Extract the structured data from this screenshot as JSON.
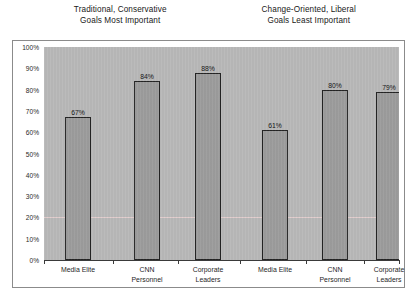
{
  "titles": {
    "left": {
      "line1": "Traditional, Conservative",
      "line2": "Goals Most Important"
    },
    "right": {
      "line1": "Change-Oriented, Liberal",
      "line2": "Goals Least Important"
    }
  },
  "chart_data": {
    "type": "bar",
    "xlabel": "",
    "ylabel": "",
    "ylim": [
      0,
      100
    ],
    "grid": true,
    "gridlines_at": [
      20
    ],
    "legend": "none",
    "yticks": [
      0,
      10,
      20,
      30,
      40,
      50,
      60,
      70,
      80,
      90,
      100
    ],
    "ytick_labels": [
      "0%",
      "10%",
      "20%",
      "30%",
      "40%",
      "50%",
      "60%",
      "70%",
      "80%",
      "90%",
      "100%"
    ],
    "groups": [
      {
        "name": "Traditional, Conservative Goals Most Important",
        "categories": [
          "Media Elite",
          "CNN Personnel",
          "Corporate Leaders"
        ],
        "values": [
          67,
          84,
          88
        ],
        "data_labels": [
          "67%",
          "84%",
          "88%"
        ]
      },
      {
        "name": "Change-Oriented, Liberal Goals Least Important",
        "categories": [
          "Media Elite",
          "CNN Personnel",
          "Corporate Leaders"
        ],
        "values": [
          61,
          80,
          79
        ],
        "data_labels": [
          "61%",
          "80%",
          "79%"
        ]
      }
    ],
    "categories": [
      "Media Elite",
      "CNN Personnel",
      "Corporate Leaders",
      "Media Elite",
      "CNN Personnel",
      "Corporate Leaders"
    ],
    "values": [
      67,
      84,
      88,
      61,
      80,
      79
    ],
    "colors": {
      "bar_fill": "#9d9d9d",
      "bar_outline": "#242424",
      "plot_background": "#b9b9b9",
      "panel_background": "#ffffff",
      "gridline": "#e2cece",
      "text": "#1a1a1a"
    }
  },
  "category_labels": [
    {
      "line1": "Media Elite",
      "line2": ""
    },
    {
      "line1": "CNN",
      "line2": "Personnel"
    },
    {
      "line1": "Corporate",
      "line2": "Leaders"
    },
    {
      "line1": "Media Elite",
      "line2": ""
    },
    {
      "line1": "CNN",
      "line2": "Personnel"
    },
    {
      "line1": "Corporate",
      "line2": "Leaders"
    }
  ]
}
